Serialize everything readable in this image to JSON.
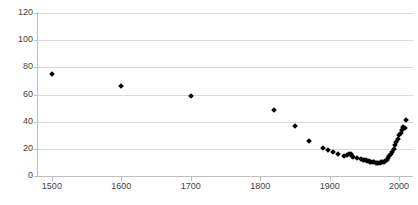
{
  "chart_data": {
    "type": "scatter",
    "title": "",
    "subtitle": "",
    "xlabel": "",
    "ylabel": "",
    "xlim": [
      1480,
      2020
    ],
    "ylim": [
      0,
      120
    ],
    "grid": true,
    "legend": null,
    "marker": {
      "shape": "diamond",
      "color": "#000000",
      "size": 4
    },
    "yticks": [
      0,
      20,
      40,
      60,
      80,
      100,
      120
    ],
    "xticks": [
      1500,
      1600,
      1700,
      1800,
      1900,
      2000
    ],
    "ytick_labels": [
      "0",
      "20",
      "40",
      "60",
      "80",
      "100",
      "120"
    ],
    "xtick_labels": [
      "1500",
      "1600",
      "1700",
      "1800",
      "1900",
      "2000"
    ],
    "series": [
      {
        "name": "series-1",
        "points": [
          [
            1500,
            75.0
          ],
          [
            1600,
            66.5
          ],
          [
            1700,
            59.0
          ],
          [
            1820,
            48.5
          ],
          [
            1850,
            36.5
          ],
          [
            1870,
            25.5
          ],
          [
            1890,
            20.5
          ],
          [
            1897,
            19.0
          ],
          [
            1905,
            17.5
          ],
          [
            1912,
            16.0
          ],
          [
            1920,
            15.0
          ],
          [
            1925,
            15.5
          ],
          [
            1928,
            16.5
          ],
          [
            1930,
            16.0
          ],
          [
            1932,
            15.0
          ],
          [
            1934,
            14.0
          ],
          [
            1940,
            13.0
          ],
          [
            1945,
            12.5
          ],
          [
            1948,
            12.0
          ],
          [
            1950,
            11.5
          ],
          [
            1952,
            11.5
          ],
          [
            1954,
            11.0
          ],
          [
            1956,
            11.0
          ],
          [
            1958,
            10.5
          ],
          [
            1960,
            10.5
          ],
          [
            1962,
            10.0
          ],
          [
            1964,
            10.0
          ],
          [
            1966,
            9.5
          ],
          [
            1968,
            9.5
          ],
          [
            1970,
            9.5
          ],
          [
            1972,
            9.5
          ],
          [
            1974,
            10.0
          ],
          [
            1976,
            10.0
          ],
          [
            1978,
            10.5
          ],
          [
            1980,
            11.0
          ],
          [
            1982,
            12.0
          ],
          [
            1984,
            13.0
          ],
          [
            1986,
            14.5
          ],
          [
            1988,
            16.0
          ],
          [
            1990,
            18.0
          ],
          [
            1992,
            20.0
          ],
          [
            1994,
            22.5
          ],
          [
            1996,
            25.0
          ],
          [
            1998,
            27.5
          ],
          [
            2000,
            30.0
          ],
          [
            2002,
            32.0
          ],
          [
            2004,
            34.0
          ],
          [
            2005,
            35.0
          ],
          [
            2006,
            36.0
          ],
          [
            2008,
            35.0
          ],
          [
            2010,
            41.0
          ]
        ]
      }
    ]
  }
}
